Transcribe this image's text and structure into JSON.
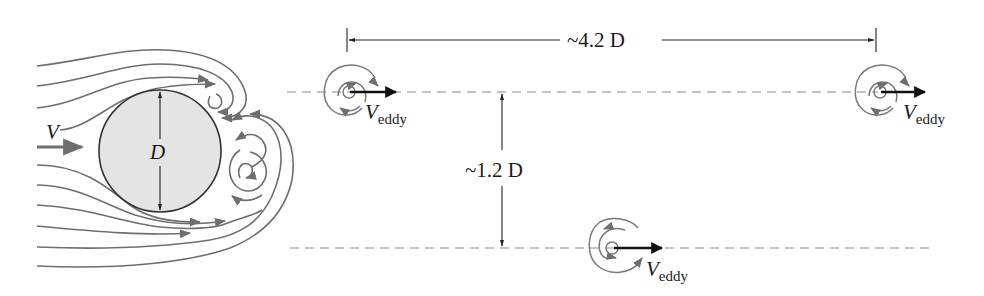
{
  "figure": {
    "colors": {
      "streamline": "#6e6e6e",
      "cylinder_fill": "#e4e4e4",
      "cylinder_stroke": "#333333",
      "dimension": "#222222",
      "dashed": "#8a8a8a",
      "eddy_arrow": "#111111",
      "text": "#1a1a1a"
    }
  },
  "labels": {
    "freestream_velocity": "V",
    "diameter": "D",
    "streamwise_spacing": "~4.2 D",
    "lateral_spacing": "~1.2 D",
    "eddy_velocity_symbol": "V",
    "eddy_velocity_subscript": "eddy"
  },
  "eddies": [
    {
      "id": "eddy-upper-left",
      "cx": 347,
      "cy": 92,
      "rotation": "clockwise"
    },
    {
      "id": "eddy-upper-right",
      "cx": 878,
      "cy": 92,
      "rotation": "clockwise"
    },
    {
      "id": "eddy-lower",
      "cx": 612,
      "cy": 248,
      "rotation": "counterclockwise"
    }
  ],
  "dimensions": {
    "streamwise": {
      "x1": 347,
      "x2": 876,
      "y": 40,
      "value": "~4.2 D"
    },
    "lateral": {
      "x": 502,
      "y1": 92,
      "y2": 248,
      "value": "~1.2 D"
    }
  }
}
